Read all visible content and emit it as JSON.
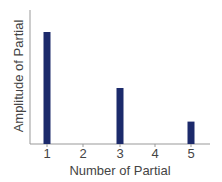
{
  "chart_data": {
    "type": "bar",
    "title": "",
    "xlabel": "Number of Partial",
    "ylabel": "Amplitude of Partial",
    "categories": [
      "1",
      "2",
      "3",
      "4",
      "5"
    ],
    "values": [
      1.0,
      0,
      0.5,
      0,
      0.2
    ],
    "ylim": [
      0,
      1.2
    ],
    "grid": false,
    "legend": null,
    "bar_color": "#1c2a6b",
    "axis_color": "#999999"
  }
}
